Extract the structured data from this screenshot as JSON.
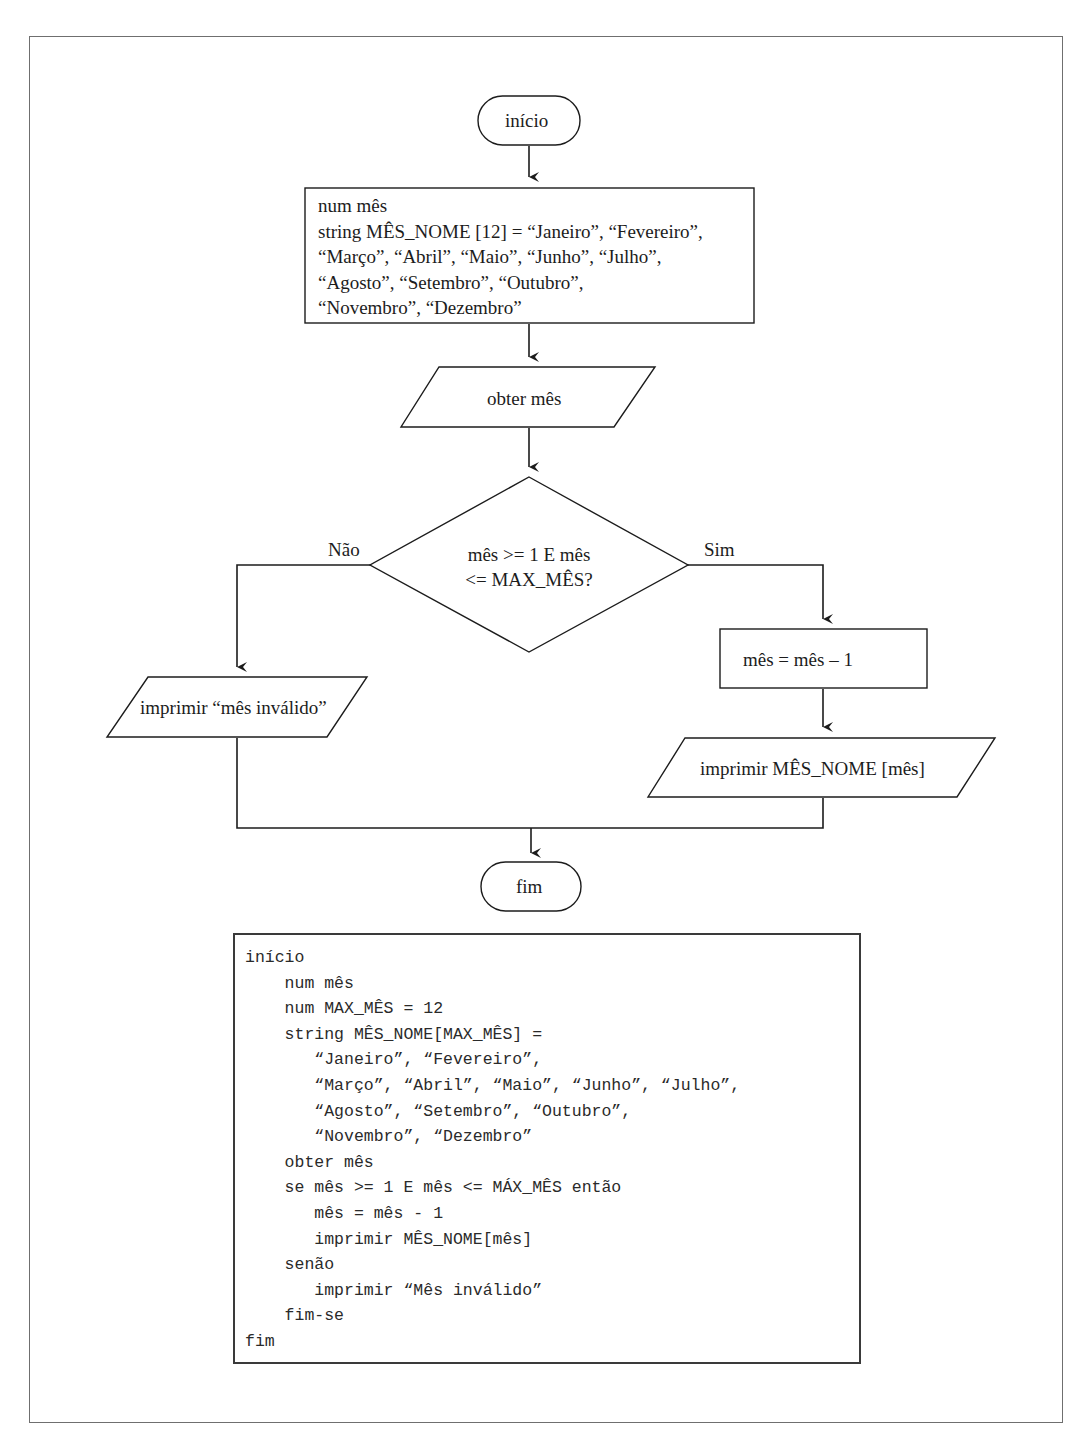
{
  "flowchart": {
    "start_label": "início",
    "declaration_lines": [
      "num mês",
      "string MÊS_NOME [12] = “Janeiro”, “Fevereiro”,",
      "“Março”, “Abril”, “Maio”, “Junho”, “Julho”,",
      "“Agosto”, “Setembro”, “Outubro”,",
      "“Novembro”, “Dezembro”"
    ],
    "input_label": "obter mês",
    "decision_line1": "mês >= 1 E mês",
    "decision_line2": "<= MAX_MÊS?",
    "no_label": "Não",
    "yes_label": "Sim",
    "invalid_output": "imprimir “mês inválido”",
    "decrement_label": "mês = mês – 1",
    "print_name_output": "imprimir MÊS_NOME [mês]",
    "end_label": "fim"
  },
  "pseudocode": {
    "lines": [
      "início",
      "    num mês",
      "    num MAX_MÊS = 12",
      "    string MÊS_NOME[MAX_MÊS] =",
      "       “Janeiro”, “Fevereiro”,",
      "       “Março”, “Abril”, “Maio”, “Junho”, “Julho”,",
      "       “Agosto”, “Setembro”, “Outubro”,",
      "       “Novembro”, “Dezembro”",
      "    obter mês",
      "    se mês >= 1 E mês <= MÁX_MÊS então",
      "       mês = mês - 1",
      "       imprimir MÊS_NOME[mês]",
      "    senão",
      "       imprimir “Mês inválido”",
      "    fim-se",
      "fim"
    ]
  },
  "colors": {
    "stroke": "#1c1c1c",
    "frame": "#6f6f6f"
  }
}
